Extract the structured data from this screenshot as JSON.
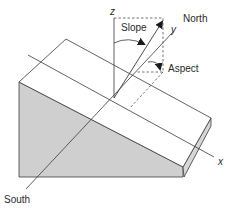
{
  "diagram": {
    "labels": {
      "z_axis": "z",
      "y_axis": "y",
      "x_axis": "x",
      "slope": "Slope",
      "aspect": "Aspect",
      "north": "North",
      "south": "South"
    },
    "colors": {
      "line": "#3a3a3a",
      "shade": "#cfcfcf",
      "edge_shade": "#d6d6d6",
      "background": "#ffffff"
    }
  }
}
